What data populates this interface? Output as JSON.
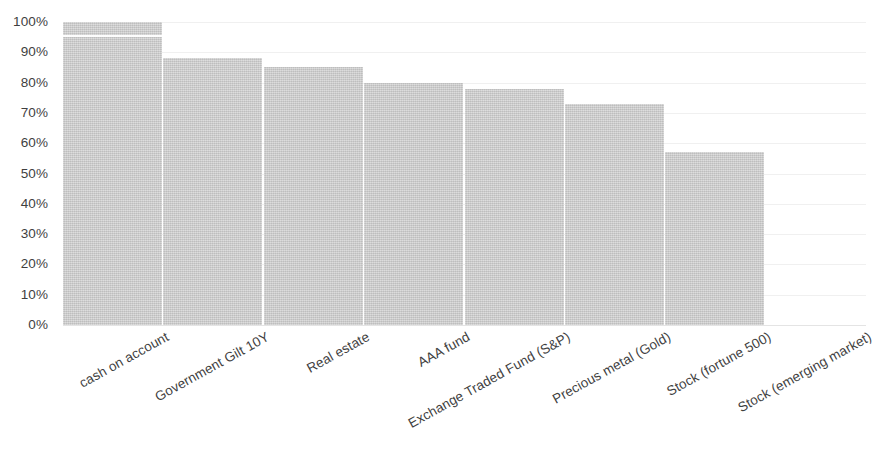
{
  "chart_data": {
    "type": "bar",
    "title": "",
    "subtitle": "",
    "xlabel": "",
    "ylabel": "",
    "categories": [
      "cash on account",
      "Government Gilt 10Y",
      "Real estate",
      "AAA fund",
      "Exchange Traded Fund (S&P)",
      "Precious metal (Gold)",
      "Stock (fortune 500)",
      "Stock (emerging market)"
    ],
    "values": [
      100,
      88,
      85,
      80,
      78,
      73,
      57,
      0
    ],
    "value_labels": [
      "100%",
      "88%",
      "85%",
      "80%",
      "78%",
      "73%",
      "57%",
      "0%"
    ],
    "ylim": [
      0,
      100
    ],
    "ytick_labels": [
      "0%",
      "10%",
      "20%",
      "30%",
      "40%",
      "50%",
      "60%",
      "70%",
      "80%",
      "90%",
      "100%"
    ],
    "ytick_values": [
      0,
      10,
      20,
      30,
      40,
      50,
      60,
      70,
      80,
      90,
      100
    ],
    "grid": true,
    "grid_axis": "y",
    "legend": false,
    "legend_position": "none",
    "series": [
      {
        "name": "",
        "values": [
          100,
          88,
          85,
          80,
          78,
          73,
          57,
          0
        ]
      }
    ]
  },
  "style": {
    "bar_color": "#c9c9c9",
    "background_color": "#ffffff",
    "grid_color": "#f0f0f0",
    "baseline_color": "#e4e4e4",
    "text_color": "#3f3f3f",
    "x_label_rotation_deg": -29
  }
}
